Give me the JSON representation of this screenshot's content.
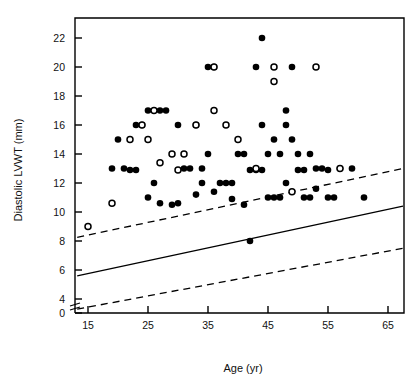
{
  "chart_data": {
    "type": "scatter",
    "title": "",
    "xlabel": "Age (yr)",
    "ylabel": "Diastolic LVWT (mm)",
    "xlim": [
      13,
      68
    ],
    "ylim": [
      3.2,
      23.0
    ],
    "xticks": [
      15,
      25,
      35,
      45,
      55,
      65
    ],
    "yticks": [
      0,
      4,
      6,
      8,
      10,
      12,
      14,
      16,
      18,
      20,
      22
    ],
    "y_axis_break": true,
    "y_axis_break_between": [
      0,
      4
    ],
    "grid": false,
    "legend": null,
    "marker_colors": {
      "filled": "#000000",
      "open_stroke": "#000000",
      "open_fill": "#ffffff"
    },
    "series": [
      {
        "name": "filled-circles",
        "marker": "filled-circle",
        "points": [
          [
            19,
            13
          ],
          [
            21,
            13
          ],
          [
            20,
            15
          ],
          [
            23,
            16
          ],
          [
            24,
            16
          ],
          [
            25,
            17
          ],
          [
            27,
            17
          ],
          [
            28,
            17
          ],
          [
            22,
            12.9
          ],
          [
            23,
            12.9
          ],
          [
            26,
            12
          ],
          [
            27,
            10.6
          ],
          [
            29,
            10.5
          ],
          [
            25,
            11
          ],
          [
            31,
            13
          ],
          [
            32,
            13
          ],
          [
            30,
            16
          ],
          [
            33,
            16
          ],
          [
            35,
            20
          ],
          [
            36,
            20
          ],
          [
            34,
            13
          ],
          [
            35,
            14
          ],
          [
            37,
            12
          ],
          [
            38,
            12
          ],
          [
            39,
            12
          ],
          [
            36,
            11.4
          ],
          [
            40,
            14
          ],
          [
            41,
            14
          ],
          [
            41,
            10.5
          ],
          [
            42,
            8
          ],
          [
            44,
            22
          ],
          [
            43,
            20
          ],
          [
            44,
            16
          ],
          [
            45,
            14
          ],
          [
            42,
            12.9
          ],
          [
            43,
            12.9
          ],
          [
            44,
            12.9
          ],
          [
            45,
            11
          ],
          [
            46,
            11
          ],
          [
            47,
            11
          ],
          [
            47,
            14
          ],
          [
            48,
            12
          ],
          [
            49,
            20
          ],
          [
            48,
            16
          ],
          [
            49,
            15
          ],
          [
            50,
            14
          ],
          [
            50,
            12.9
          ],
          [
            51,
            12.9
          ],
          [
            51,
            11
          ],
          [
            52,
            11
          ],
          [
            52,
            14
          ],
          [
            53,
            13
          ],
          [
            54,
            13
          ],
          [
            53,
            11.6
          ],
          [
            55,
            12.9
          ],
          [
            55,
            11
          ],
          [
            56,
            11
          ],
          [
            57,
            13
          ],
          [
            59,
            13
          ],
          [
            61,
            11
          ],
          [
            30,
            10.6
          ],
          [
            33,
            11.2
          ],
          [
            46,
            15
          ],
          [
            48,
            17
          ],
          [
            39,
            10.9
          ],
          [
            34,
            12
          ]
        ]
      },
      {
        "name": "open-circles",
        "marker": "open-circle",
        "points": [
          [
            15,
            9
          ],
          [
            19,
            10.6
          ],
          [
            22,
            15
          ],
          [
            25,
            15
          ],
          [
            24,
            16
          ],
          [
            26,
            17
          ],
          [
            29,
            14
          ],
          [
            31,
            14
          ],
          [
            33,
            16
          ],
          [
            36,
            20
          ],
          [
            38,
            16
          ],
          [
            40,
            15
          ],
          [
            43,
            13
          ],
          [
            46,
            20
          ],
          [
            46,
            19
          ],
          [
            49,
            11.4
          ],
          [
            53,
            20
          ],
          [
            57,
            13
          ],
          [
            36,
            17
          ],
          [
            30,
            12.9
          ],
          [
            27,
            13.4
          ]
        ]
      }
    ],
    "lines": [
      {
        "name": "regression-line",
        "style": "solid",
        "x": [
          13.2,
          67.5
        ],
        "y": [
          5.6,
          10.4
        ]
      },
      {
        "name": "upper-prediction-limit",
        "style": "dashed",
        "x": [
          13.2,
          67.5
        ],
        "y": [
          8.25,
          13.0
        ]
      },
      {
        "name": "lower-prediction-limit",
        "style": "dashed",
        "x": [
          13.2,
          67.5
        ],
        "y": [
          3.3,
          7.5
        ]
      }
    ]
  },
  "figure": {
    "xlabel": "Age (yr)",
    "ylabel": "Diastolic LVWT (mm)",
    "xtick_labels": [
      "15",
      "25",
      "35",
      "45",
      "55",
      "65"
    ],
    "ytick_labels": [
      "22",
      "20",
      "18",
      "16",
      "14",
      "12",
      "10",
      "8",
      "6",
      "4",
      "0"
    ],
    "background_color": "#ffffff",
    "frame_color": "#000000"
  }
}
